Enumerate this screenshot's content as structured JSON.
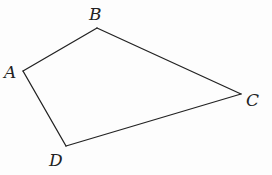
{
  "diagram": {
    "type": "quadrilateral",
    "stroke_color": "#222222",
    "background": "#fdfdfd",
    "vertices": [
      {
        "name": "A",
        "x": 23,
        "y": 71,
        "label_x": 4,
        "label_y": 78
      },
      {
        "name": "B",
        "x": 97,
        "y": 28,
        "label_x": 89,
        "label_y": 20
      },
      {
        "name": "C",
        "x": 241,
        "y": 94,
        "label_x": 246,
        "label_y": 106
      },
      {
        "name": "D",
        "x": 66,
        "y": 146,
        "label_x": 49,
        "label_y": 166
      }
    ],
    "edges": [
      {
        "from": "A",
        "to": "B"
      },
      {
        "from": "B",
        "to": "C"
      },
      {
        "from": "C",
        "to": "D"
      },
      {
        "from": "D",
        "to": "A"
      }
    ]
  }
}
